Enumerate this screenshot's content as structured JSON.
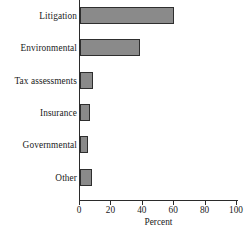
{
  "chart_data": {
    "type": "bar",
    "orientation": "horizontal",
    "title": "",
    "subtitle": "",
    "xlabel": "Percent",
    "ylabel": "",
    "categories": [
      "Litigation",
      "Environmental",
      "Tax assessments",
      "Insurance",
      "Governmental",
      "Other"
    ],
    "values": [
      60,
      38,
      8,
      6.5,
      5,
      7.5
    ],
    "xlim": [
      0,
      100
    ],
    "xticks": [
      0,
      20,
      40,
      60,
      80,
      100
    ],
    "xtick_labels": [
      "0",
      "20",
      "40",
      "60",
      "80",
      "100"
    ],
    "grid": false,
    "legend": false,
    "bar_fill_color": "#8a8a8a",
    "bar_edge_color": "#2e2e2e",
    "axis_color": "#2b2b2b",
    "background_color": "#ffffff"
  }
}
